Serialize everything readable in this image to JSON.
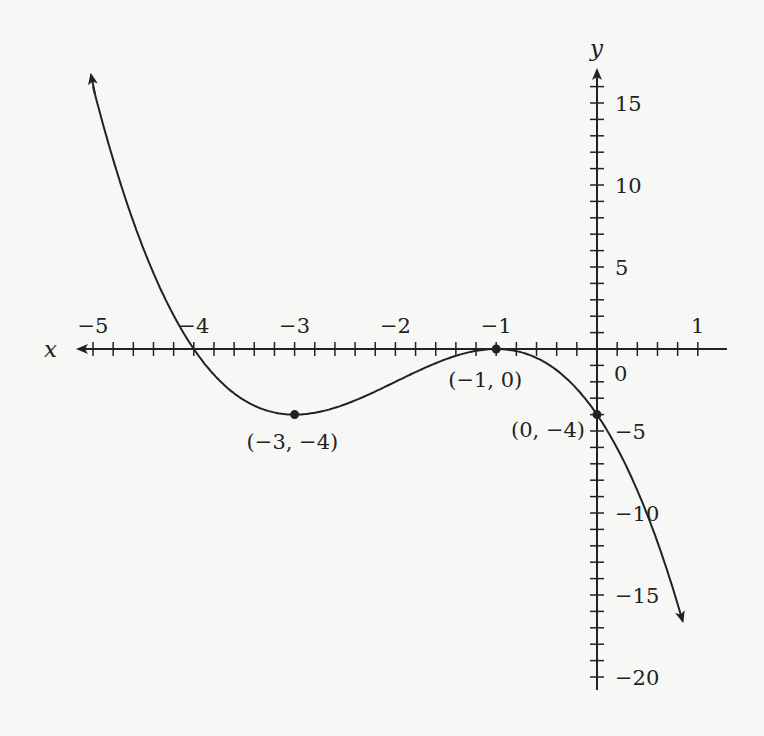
{
  "chart_data": {
    "type": "line",
    "title": "",
    "xlabel": "x",
    "ylabel": "y",
    "function": "f(x) = -(x+1)^2 (x+4)",
    "xlim": [
      -5,
      1
    ],
    "ylim": [
      -22,
      17
    ],
    "x_ticks": [
      -5,
      -4,
      -3,
      -2,
      -1,
      1
    ],
    "x_tick_labels": [
      "−5",
      "−4",
      "−3",
      "−2",
      "−1",
      "1"
    ],
    "x_minor_step": 0.2,
    "y_ticks": [
      15,
      10,
      5,
      -5,
      -10,
      -15,
      -20
    ],
    "y_tick_labels": [
      "15",
      "10",
      "5",
      "−5",
      "−10",
      "−15",
      "−20"
    ],
    "y_minor_step": 1,
    "origin_label": "0",
    "series": [
      {
        "name": "curve",
        "x": [
          -5,
          -4.5,
          -4,
          -3.5,
          -3,
          -2.5,
          -2,
          -1.5,
          -1,
          -0.5,
          0,
          0.5,
          0.9
        ],
        "y": [
          16,
          4.38,
          0,
          -1.13,
          -4,
          -3.38,
          -2,
          -0.63,
          0,
          -0.88,
          -4,
          -10.13,
          -17.7
        ]
      }
    ],
    "points": [
      {
        "x": -3,
        "y": -4,
        "label": "(−3, −4)"
      },
      {
        "x": -1,
        "y": 0,
        "label": "(−1, 0)"
      },
      {
        "x": 0,
        "y": -4,
        "label": "(0, −4)"
      }
    ],
    "grid": false,
    "legend": null
  },
  "labels": {
    "x_axis": "x",
    "y_axis": "y",
    "origin": "0"
  },
  "colors": {
    "background": "#f7f7f5",
    "ink": "#222222"
  }
}
